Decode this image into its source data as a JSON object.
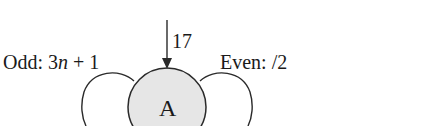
{
  "diagram": {
    "type": "state-machine",
    "state": {
      "label": "A",
      "fill": "#e6e6e6",
      "stroke": "#2a2a2a"
    },
    "entry_arrow": {
      "label": "17"
    },
    "transitions": {
      "odd": {
        "prefix": "Odd: 3",
        "var": "n",
        "suffix": " + 1"
      },
      "even": {
        "label": "Even: /2"
      }
    }
  }
}
